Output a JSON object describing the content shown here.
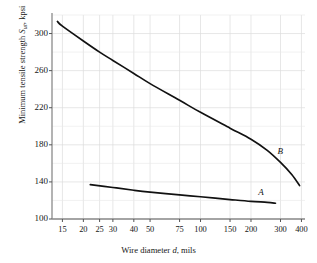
{
  "chart_data": {
    "type": "line",
    "title": "",
    "xlabel": "Wire diameter d, mils",
    "ylabel": "Minimum tensile strength Sut, kpsi",
    "xscale": "log",
    "yscale": "linear",
    "xlim": [
      13,
      420
    ],
    "ylim": [
      100,
      320
    ],
    "grid": true,
    "legend": "inline-curve-labels",
    "xticks": [
      15,
      20,
      25,
      30,
      40,
      50,
      75,
      100,
      150,
      200,
      300,
      400
    ],
    "xtick_labels": [
      "15",
      "20",
      "25",
      "30",
      "40",
      "50",
      "75",
      "100",
      "150",
      "200",
      "300",
      "400"
    ],
    "yticks": [
      100,
      140,
      180,
      220,
      260,
      300
    ],
    "ytick_labels": [
      "100",
      "140",
      "180",
      "220",
      "260",
      "300"
    ],
    "series": [
      {
        "name": "A",
        "label": "A",
        "color": "#111111",
        "points": [
          {
            "x": 22,
            "y": 137
          },
          {
            "x": 30,
            "y": 134
          },
          {
            "x": 40,
            "y": 131
          },
          {
            "x": 50,
            "y": 129
          },
          {
            "x": 75,
            "y": 126
          },
          {
            "x": 100,
            "y": 124
          },
          {
            "x": 150,
            "y": 121
          },
          {
            "x": 200,
            "y": 119
          },
          {
            "x": 250,
            "y": 118
          },
          {
            "x": 280,
            "y": 117
          }
        ]
      },
      {
        "name": "B",
        "label": "B",
        "color": "#111111",
        "points": [
          {
            "x": 14,
            "y": 313
          },
          {
            "x": 15,
            "y": 308
          },
          {
            "x": 20,
            "y": 292
          },
          {
            "x": 25,
            "y": 280
          },
          {
            "x": 30,
            "y": 271
          },
          {
            "x": 40,
            "y": 257
          },
          {
            "x": 50,
            "y": 246
          },
          {
            "x": 75,
            "y": 228
          },
          {
            "x": 100,
            "y": 215
          },
          {
            "x": 150,
            "y": 198
          },
          {
            "x": 200,
            "y": 186
          },
          {
            "x": 250,
            "y": 174
          },
          {
            "x": 300,
            "y": 161
          },
          {
            "x": 350,
            "y": 148
          },
          {
            "x": 390,
            "y": 136
          }
        ]
      }
    ],
    "annotations": [
      {
        "text": "A",
        "x": 230,
        "y": 128,
        "style": "italic"
      },
      {
        "text": "B",
        "x": 300,
        "y": 172,
        "style": "italic"
      }
    ]
  },
  "axes": {
    "x_label_text": "Wire diameter ",
    "x_label_var": "d",
    "x_label_tail": ", mils",
    "y_label_text": "Minimum tensile strength ",
    "y_label_var": "S",
    "y_label_sub": "ut",
    "y_label_tail": ", kpsi"
  }
}
